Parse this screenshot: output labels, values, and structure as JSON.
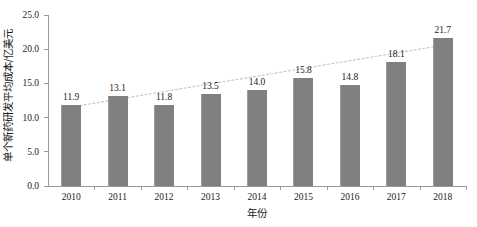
{
  "chart_data": {
    "type": "bar",
    "title": "",
    "subtitle": "",
    "xlabel": "年份",
    "ylabel": "单个新药研发平均成本/亿美元",
    "categories": [
      "2010",
      "2011",
      "2012",
      "2013",
      "2014",
      "2015",
      "2016",
      "2017",
      "2018"
    ],
    "values": [
      11.9,
      13.1,
      11.8,
      13.5,
      14.0,
      15.8,
      14.8,
      18.1,
      21.7
    ],
    "value_labels": [
      "11.9",
      "13.1",
      "11.8",
      "13.5",
      "14.0",
      "15.8",
      "14.8",
      "18.1",
      "21.7"
    ],
    "series": [
      {
        "name": "单个新药研发平均成本",
        "type": "bar",
        "values": [
          11.9,
          13.1,
          11.8,
          13.5,
          14.0,
          15.8,
          14.8,
          18.1,
          21.7
        ],
        "color": "#808080"
      },
      {
        "name": "趋势线",
        "type": "line",
        "style": "dotted",
        "color": "#c8c8c8",
        "values": [
          11.55,
          12.68,
          13.81,
          14.94,
          16.06,
          17.19,
          18.32,
          19.45,
          20.58
        ]
      }
    ],
    "ylim": [
      0.0,
      25.0
    ],
    "y_ticks": [
      "0.0",
      "5.0",
      "10.0",
      "15.0",
      "20.0",
      "25.0"
    ],
    "y_tick_values": [
      0.0,
      5.0,
      10.0,
      15.0,
      20.0,
      25.0
    ],
    "grid": false,
    "legend": "none",
    "bar_color": "#808080",
    "trendline_color": "#c8c8c8",
    "axis_color": "#9a9a9a",
    "text_color": "#1a1a1a",
    "background": "#ffffff"
  }
}
